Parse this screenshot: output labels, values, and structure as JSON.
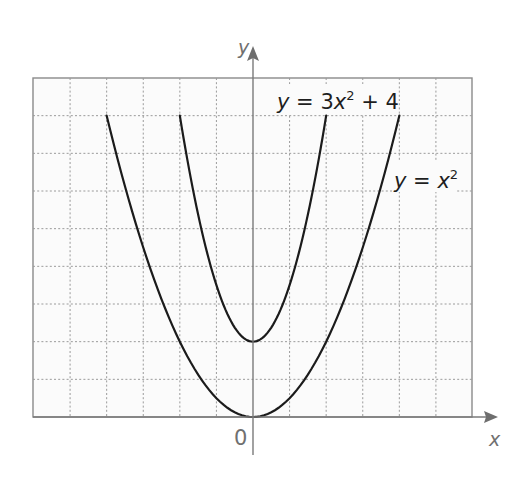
{
  "chart_data": {
    "type": "line",
    "title": "",
    "xlabel": "x",
    "ylabel": "y",
    "origin_label": "0",
    "xlim": [
      -6,
      6
    ],
    "ylim": [
      0,
      18
    ],
    "grid": true,
    "grid_step": {
      "x": 1,
      "y": 2
    },
    "tick_labels": false,
    "series": [
      {
        "name": "y = x^2",
        "label": {
          "parts": [
            "y",
            " = ",
            "x",
            "2",
            "",
            ""
          ]
        },
        "a": 1,
        "c": 0,
        "x_range": [
          -4,
          4
        ],
        "points": [
          [
            -4,
            16
          ],
          [
            -3,
            9
          ],
          [
            -2,
            4
          ],
          [
            -1,
            1
          ],
          [
            0,
            0
          ],
          [
            1,
            1
          ],
          [
            2,
            4
          ],
          [
            3,
            9
          ],
          [
            4,
            16
          ]
        ]
      },
      {
        "name": "y = 3x^2 + 4",
        "label": {
          "parts": [
            "y",
            " = 3",
            "x",
            "2",
            " + 4",
            ""
          ]
        },
        "a": 3,
        "c": 4,
        "x_range": [
          -2,
          2
        ],
        "points": [
          [
            -2,
            16
          ],
          [
            -1,
            7
          ],
          [
            0,
            4
          ],
          [
            1,
            7
          ],
          [
            2,
            16
          ]
        ]
      }
    ],
    "colors": {
      "curve": "#1b1b1b",
      "axis": "#7a7a7a",
      "grid": "#9a9a9a",
      "frame_fill": "#fbfbfb"
    }
  }
}
